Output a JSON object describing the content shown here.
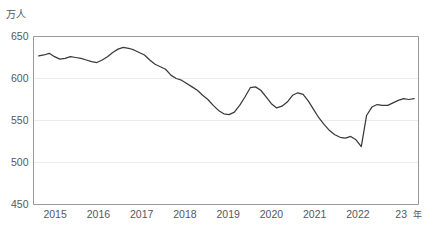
{
  "chart_data": {
    "type": "line",
    "title": "",
    "subtitle": "",
    "xlabel": "",
    "ylabel": "万人",
    "y_unit_label": "万人",
    "x_unit_label": "年",
    "ylim": [
      450,
      650
    ],
    "y_ticks": [
      450,
      500,
      550,
      600,
      650
    ],
    "y_tick_labels": [
      "450",
      "500",
      "550",
      "600",
      "650"
    ],
    "xlim": [
      2014.5,
      2023.4
    ],
    "x_ticks": [
      2015,
      2016,
      2017,
      2018,
      2019,
      2020,
      2021,
      2022,
      2023
    ],
    "x_tick_labels": [
      "2015",
      "2016",
      "2017",
      "2018",
      "2019",
      "2020",
      "2021",
      "2022",
      "23"
    ],
    "grid": true,
    "grid_axis": "y",
    "legend": false,
    "legend_position": "none",
    "line_color": "#3a3a3a",
    "grid_color": "#e7e7e7",
    "frame_color": "#8d8d8d",
    "series": [
      {
        "name": "就業者数",
        "x": [
          2014.6,
          2014.85,
          2015.1,
          2015.35,
          2015.6,
          2015.85,
          2016.1,
          2016.35,
          2016.6,
          2016.85,
          2017.1,
          2017.35,
          2017.6,
          2017.85,
          2018.1,
          2018.35,
          2018.6,
          2018.85,
          2019.1,
          2019.35,
          2019.6,
          2019.85,
          2020.1,
          2020.35,
          2020.6,
          2020.85,
          2021.1,
          2021.35,
          2021.6,
          2021.85,
          2022.1,
          2022.35,
          2022.6,
          2022.85,
          2023.1,
          2023.3
        ],
        "values": [
          627,
          629,
          624,
          622,
          625,
          624,
          620,
          618,
          622,
          624,
          630,
          636,
          637,
          635,
          633,
          628,
          622,
          618,
          612,
          605,
          602,
          598,
          588,
          578,
          565,
          558,
          557,
          563,
          572,
          590,
          585,
          570,
          562,
          571,
          580,
          576
        ]
      }
    ],
    "annotations": []
  },
  "series_points": {
    "values": [
      627,
      628,
      630,
      626,
      623,
      624,
      626,
      625,
      624,
      622,
      620,
      619,
      622,
      626,
      631,
      635,
      637,
      636,
      634,
      631,
      628,
      622,
      617,
      614,
      611,
      604,
      600,
      598,
      594,
      590,
      586,
      580,
      575,
      568,
      562,
      558,
      557,
      560,
      568,
      578,
      589,
      590,
      586,
      578,
      570,
      565,
      567,
      572,
      580,
      583,
      581,
      573,
      563,
      553,
      545,
      538,
      533,
      530,
      529,
      531,
      527,
      519,
      556,
      566,
      569,
      568,
      568,
      571,
      574,
      576,
      575,
      576
    ]
  }
}
